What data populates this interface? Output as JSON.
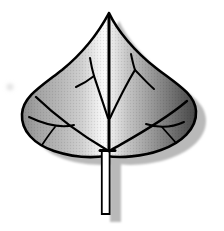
{
  "illustration": {
    "name": "leaf-illustration",
    "description": "Grayscale line-art drawing of a cordate (heart-shaped) leaf with a pointed apex, branching veins, a long straight petiole, glossy horizontal gradient shading and a soft gray drop shadow offset to the lower right",
    "colors": {
      "background": "#ffffff",
      "outline": "#000000",
      "vein": "#000000",
      "stem_fill": "#ffffff",
      "shadow": "#b9b9b9",
      "artifact": "#d9d9d9"
    },
    "gradient": {
      "direction": "left-to-right",
      "stops": [
        {
          "offset": "0%",
          "color": "#8c8c8c"
        },
        {
          "offset": "8%",
          "color": "#a2a2a2"
        },
        {
          "offset": "22%",
          "color": "#b8b8b8"
        },
        {
          "offset": "34%",
          "color": "#cfcfcf"
        },
        {
          "offset": "43%",
          "color": "#eeeeee"
        },
        {
          "offset": "47%",
          "color": "#fbfbfb"
        },
        {
          "offset": "52%",
          "color": "#e8e8e8"
        },
        {
          "offset": "60%",
          "color": "#c6c6c6"
        },
        {
          "offset": "72%",
          "color": "#a0a0a0"
        },
        {
          "offset": "84%",
          "color": "#787878"
        },
        {
          "offset": "93%",
          "color": "#5a5a5a"
        },
        {
          "offset": "100%",
          "color": "#454545"
        }
      ]
    },
    "shadow_offset": {
      "x": 10,
      "y": 8
    }
  }
}
